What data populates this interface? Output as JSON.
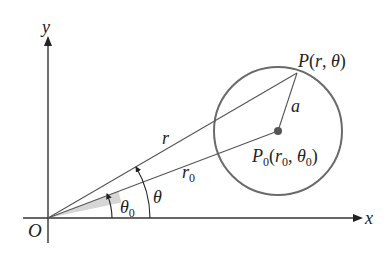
{
  "diagram": {
    "colors": {
      "axis": "#333333",
      "line": "#555555",
      "circle": "#6a6a6a",
      "wedge": "#d4d4d4",
      "center_dot": "#555555",
      "text": "#222222"
    },
    "axes": {
      "x_label": "x",
      "y_label": "y",
      "origin_label": "O"
    },
    "points": {
      "P": {
        "name": "P",
        "label_open": "(",
        "coord_1": "r",
        "sep": ", ",
        "coord_2": "θ",
        "label_close": ")"
      },
      "P0": {
        "name": "P",
        "name_sub": "0",
        "label_open": "(",
        "coord_1": "r",
        "coord_1_sub": "0",
        "sep": ", ",
        "coord_2": "θ",
        "coord_2_sub": "0",
        "label_close": ")"
      }
    },
    "segments": {
      "r_label": "r",
      "r0_label": "r",
      "r0_sub": "0",
      "a_label": "a"
    },
    "angles": {
      "theta_label": "θ",
      "theta0_label": "θ",
      "theta0_sub": "0"
    }
  }
}
